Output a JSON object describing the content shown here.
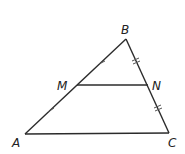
{
  "diagram": {
    "type": "triangle-midsegment",
    "stroke_color": "#2b2b2b",
    "points": {
      "A": {
        "label": "A",
        "x": 25,
        "y": 134
      },
      "B": {
        "label": "B",
        "x": 126,
        "y": 39
      },
      "C": {
        "label": "C",
        "x": 169,
        "y": 133
      },
      "M": {
        "label": "M",
        "x": 77,
        "y": 85
      },
      "N": {
        "label": "N",
        "x": 148,
        "y": 85
      }
    },
    "segments": [
      "AB",
      "BC",
      "CA",
      "MN"
    ],
    "tick_marks": [
      {
        "segment": "AM",
        "count": 1
      },
      {
        "segment": "MB",
        "count": 1
      },
      {
        "segment": "BN",
        "count": 2
      },
      {
        "segment": "NC",
        "count": 2
      }
    ]
  }
}
